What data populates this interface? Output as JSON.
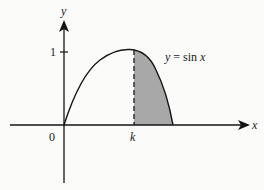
{
  "diagram": {
    "curve_label": "y = sin x",
    "curve_label_prefix": "y",
    "curve_label_eq": " = sin ",
    "curve_label_var": "x",
    "axes": {
      "x_label": "x",
      "y_label": "y",
      "origin_label": "0",
      "y_tick_label": "1",
      "x_marker_label": "k"
    },
    "shaded_region": {
      "description": "Region under y = sin x between x = k and x = π",
      "from": "k",
      "to": "π",
      "fill": "#a8a8a8"
    },
    "colors": {
      "stroke": "#141414",
      "shade": "#a8a8a8",
      "background": "#fbfbf9"
    }
  }
}
